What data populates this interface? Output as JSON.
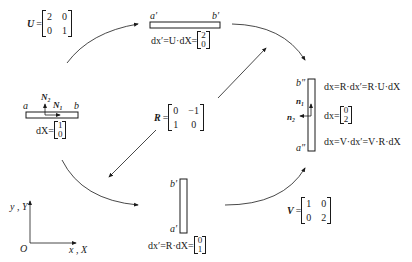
{
  "diagram": {
    "type": "polar-decomposition-flow",
    "axes": {
      "y_label": "y , Y",
      "x_label": "x , X",
      "origin_label": "O"
    },
    "matrices": {
      "U": {
        "name": "U",
        "eq": "=",
        "rows": [
          [
            "2",
            "0"
          ],
          [
            "0",
            "1"
          ]
        ]
      },
      "R": {
        "name": "R",
        "eq": "=",
        "rows": [
          [
            "0",
            "−1"
          ],
          [
            "1",
            "0"
          ]
        ]
      },
      "V": {
        "name": "V",
        "eq": "=",
        "rows": [
          [
            "1",
            "0"
          ],
          [
            "0",
            "2"
          ]
        ]
      }
    },
    "initial": {
      "label_a": "a",
      "label_b": "b",
      "normal_N2": "N₂",
      "normal_N1": "N₁",
      "eq_prefix": "dX=",
      "vector": [
        "1",
        "0"
      ]
    },
    "after_U": {
      "label_a": "a′",
      "label_b": "b′",
      "eq_prefix": "dx′=U·dX=",
      "vector": [
        "2",
        "0"
      ]
    },
    "after_R": {
      "label_a": "a′",
      "label_b": "b′",
      "eq_prefix": "dx′=R·dX=",
      "vector": [
        "0",
        "1"
      ]
    },
    "final": {
      "label_a": "a″",
      "label_b": "b″",
      "normal_n1": "n₁",
      "normal_n2": "n₂",
      "eq1": "dx=R·dx′=R·U·dX",
      "eq2_prefix": "dx=",
      "vector": [
        "0",
        "2"
      ],
      "eq3": "dx=V·dx′=V·R·dX"
    }
  }
}
